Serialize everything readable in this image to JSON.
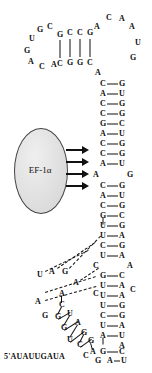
{
  "figure": {
    "type": "rna-secondary-structure",
    "protein": {
      "name": "EF-1α",
      "shape": "ellipse",
      "fill_color": "#e0e0e0",
      "stroke_color": "#444444"
    },
    "arrows": {
      "count": 4,
      "direction": "right",
      "color": "#111111",
      "meaning": "EF-1α contacts"
    },
    "five_prime_label": "5'AUAUUGAUA",
    "colors": {
      "text": "#111111",
      "bond": "#111111",
      "background": "#ffffff",
      "pseudoknot_dash": "#111111"
    },
    "legend": {
      "solid_line": "Watson-Crick base pair",
      "dashed_line": "pseudoknot / tertiary interaction"
    }
  },
  "nucleotides": [
    {
      "id": "n1",
      "base": "U",
      "x": 32,
      "y": 39
    },
    {
      "id": "n2",
      "base": "G",
      "x": 40,
      "y": 30
    },
    {
      "id": "n3",
      "base": "C",
      "x": 50,
      "y": 27
    },
    {
      "id": "n4",
      "base": "G",
      "x": 27,
      "y": 51
    },
    {
      "id": "n5",
      "base": "A",
      "x": 31,
      "y": 62
    },
    {
      "id": "n6",
      "base": "C",
      "x": 42,
      "y": 67
    },
    {
      "id": "n7",
      "base": "A",
      "x": 54,
      "y": 65
    },
    {
      "id": "s1t",
      "base": "G",
      "x": 60,
      "y": 35
    },
    {
      "id": "s2t",
      "base": "C",
      "x": 70,
      "y": 33
    },
    {
      "id": "s3t",
      "base": "C",
      "x": 80,
      "y": 33
    },
    {
      "id": "s4t",
      "base": "G",
      "x": 90,
      "y": 33
    },
    {
      "id": "s1b",
      "base": "C",
      "x": 60,
      "y": 64
    },
    {
      "id": "s2b",
      "base": "G",
      "x": 70,
      "y": 63
    },
    {
      "id": "s3b",
      "base": "G",
      "x": 80,
      "y": 63
    },
    {
      "id": "s4b",
      "base": "C",
      "x": 90,
      "y": 63
    },
    {
      "id": "t1",
      "base": "A",
      "x": 97,
      "y": 27
    },
    {
      "id": "t2",
      "base": "C",
      "x": 109,
      "y": 18
    },
    {
      "id": "t3",
      "base": "A",
      "x": 122,
      "y": 19
    },
    {
      "id": "t4",
      "base": "A",
      "x": 132,
      "y": 27
    },
    {
      "id": "t5",
      "base": "U",
      "x": 138,
      "y": 43
    },
    {
      "id": "t6",
      "base": "G",
      "x": 133,
      "y": 58
    },
    {
      "id": "t7",
      "base": "A",
      "x": 98,
      "y": 73
    },
    {
      "id": "p1l",
      "base": "C",
      "x": 103,
      "y": 84
    },
    {
      "id": "p1r",
      "base": "G",
      "x": 122,
      "y": 84
    },
    {
      "id": "p2l",
      "base": "A",
      "x": 103,
      "y": 94
    },
    {
      "id": "p2r",
      "base": "U",
      "x": 122,
      "y": 94
    },
    {
      "id": "p3l",
      "base": "C",
      "x": 103,
      "y": 104
    },
    {
      "id": "p3r",
      "base": "G",
      "x": 122,
      "y": 104
    },
    {
      "id": "p4l",
      "base": "C",
      "x": 103,
      "y": 114
    },
    {
      "id": "p4r",
      "base": "G",
      "x": 122,
      "y": 114
    },
    {
      "id": "p5l",
      "base": "G",
      "x": 103,
      "y": 124
    },
    {
      "id": "p5r",
      "base": "C",
      "x": 122,
      "y": 124
    },
    {
      "id": "p6l",
      "base": "A",
      "x": 103,
      "y": 134
    },
    {
      "id": "p6r",
      "base": "U",
      "x": 122,
      "y": 134
    },
    {
      "id": "p7l",
      "base": "C",
      "x": 103,
      "y": 144
    },
    {
      "id": "p7r",
      "base": "G",
      "x": 122,
      "y": 144
    },
    {
      "id": "p8l",
      "base": "C",
      "x": 103,
      "y": 154
    },
    {
      "id": "p8r",
      "base": "G",
      "x": 122,
      "y": 154
    },
    {
      "id": "p9l",
      "base": "A",
      "x": 103,
      "y": 164
    },
    {
      "id": "p9r",
      "base": "U",
      "x": 122,
      "y": 164
    },
    {
      "id": "il1",
      "base": "A",
      "x": 96,
      "y": 175
    },
    {
      "id": "il2",
      "base": "G",
      "x": 130,
      "y": 175
    },
    {
      "id": "q1l",
      "base": "C",
      "x": 103,
      "y": 186
    },
    {
      "id": "q1r",
      "base": "G",
      "x": 122,
      "y": 186
    },
    {
      "id": "q2l",
      "base": "A",
      "x": 103,
      "y": 196
    },
    {
      "id": "q2r",
      "base": "U",
      "x": 122,
      "y": 196
    },
    {
      "id": "q3l",
      "base": "C",
      "x": 103,
      "y": 206
    },
    {
      "id": "q3r",
      "base": "G",
      "x": 122,
      "y": 206
    },
    {
      "id": "q4l",
      "base": "G",
      "x": 103,
      "y": 216
    },
    {
      "id": "q4r",
      "base": "C",
      "x": 122,
      "y": 216
    },
    {
      "id": "q5l",
      "base": "U",
      "x": 103,
      "y": 226
    },
    {
      "id": "q5r",
      "base": "G",
      "x": 122,
      "y": 226
    },
    {
      "id": "q6l",
      "base": "U",
      "x": 103,
      "y": 236
    },
    {
      "id": "q6r",
      "base": "A",
      "x": 122,
      "y": 236
    },
    {
      "id": "q7l",
      "base": "C",
      "x": 103,
      "y": 246
    },
    {
      "id": "q7r",
      "base": "G",
      "x": 122,
      "y": 246
    },
    {
      "id": "q8l",
      "base": "U",
      "x": 103,
      "y": 256
    },
    {
      "id": "q8r",
      "base": "A",
      "x": 122,
      "y": 256
    },
    {
      "id": "pk1",
      "base": "C",
      "x": 96,
      "y": 266
    },
    {
      "id": "pk2",
      "base": "A",
      "x": 130,
      "y": 266
    },
    {
      "id": "r1l",
      "base": "G",
      "x": 103,
      "y": 276
    },
    {
      "id": "r1r",
      "base": "C",
      "x": 122,
      "y": 276
    },
    {
      "id": "r2l",
      "base": "U",
      "x": 103,
      "y": 286
    },
    {
      "id": "r2r",
      "base": "A",
      "x": 122,
      "y": 286
    },
    {
      "id": "pk3",
      "base": "C",
      "x": 96,
      "y": 294
    },
    {
      "id": "r3l",
      "base": "U",
      "x": 103,
      "y": 296
    },
    {
      "id": "r3r",
      "base": "A",
      "x": 122,
      "y": 296
    },
    {
      "id": "r3x",
      "base": "C",
      "x": 133,
      "y": 290
    },
    {
      "id": "r4l",
      "base": "U",
      "x": 103,
      "y": 306
    },
    {
      "id": "r4r",
      "base": "G",
      "x": 122,
      "y": 306
    },
    {
      "id": "r5l",
      "base": "C",
      "x": 103,
      "y": 316
    },
    {
      "id": "r5r",
      "base": "G",
      "x": 122,
      "y": 316
    },
    {
      "id": "r6l",
      "base": "U",
      "x": 103,
      "y": 326
    },
    {
      "id": "r6r",
      "base": "A",
      "x": 122,
      "y": 326
    },
    {
      "id": "r7l",
      "base": "A",
      "x": 103,
      "y": 336
    },
    {
      "id": "r7r",
      "base": "U",
      "x": 122,
      "y": 336
    },
    {
      "id": "r8x",
      "base": "A",
      "x": 122,
      "y": 346
    },
    {
      "id": "r8l",
      "base": "G",
      "x": 103,
      "y": 352
    },
    {
      "id": "r8r",
      "base": "C",
      "x": 122,
      "y": 352
    },
    {
      "id": "r9l",
      "base": "A",
      "x": 110,
      "y": 361
    },
    {
      "id": "r9r",
      "base": "U",
      "x": 124,
      "y": 361
    },
    {
      "id": "r9g",
      "base": "G",
      "x": 98,
      "y": 361
    },
    {
      "id": "b1",
      "base": "U",
      "x": 40,
      "y": 275
    },
    {
      "id": "b2",
      "base": "A",
      "x": 52,
      "y": 272
    },
    {
      "id": "b3",
      "base": "G",
      "x": 65,
      "y": 272
    },
    {
      "id": "b4",
      "base": "A",
      "x": 76,
      "y": 283
    },
    {
      "id": "c1",
      "base": "A",
      "x": 38,
      "y": 302
    },
    {
      "id": "c2",
      "base": "G",
      "x": 45,
      "y": 316
    },
    {
      "id": "c3",
      "base": "A",
      "x": 62,
      "y": 294
    },
    {
      "id": "c4",
      "base": "C",
      "x": 62,
      "y": 305
    },
    {
      "id": "c5",
      "base": "G",
      "x": 58,
      "y": 317
    },
    {
      "id": "c6",
      "base": "U",
      "x": 70,
      "y": 314
    },
    {
      "id": "c7",
      "base": "G",
      "x": 64,
      "y": 328
    },
    {
      "id": "c8",
      "base": "A",
      "x": 78,
      "y": 323
    },
    {
      "id": "c9",
      "base": "U",
      "x": 70,
      "y": 340
    },
    {
      "id": "c10",
      "base": "G",
      "x": 84,
      "y": 333
    },
    {
      "id": "c11",
      "base": "C",
      "x": 80,
      "y": 345
    },
    {
      "id": "c12",
      "base": "G",
      "x": 91,
      "y": 341
    },
    {
      "id": "c13",
      "base": "A",
      "x": 93,
      "y": 352
    },
    {
      "id": "c14",
      "base": "C",
      "x": 86,
      "y": 356
    }
  ],
  "pairs": [
    {
      "x": 60,
      "y": 49,
      "len": 18,
      "dir": "v"
    },
    {
      "x": 70,
      "y": 48,
      "len": 18,
      "dir": "v"
    },
    {
      "x": 80,
      "y": 48,
      "len": 18,
      "dir": "v"
    },
    {
      "x": 90,
      "y": 48,
      "len": 18,
      "dir": "v"
    }
  ]
}
